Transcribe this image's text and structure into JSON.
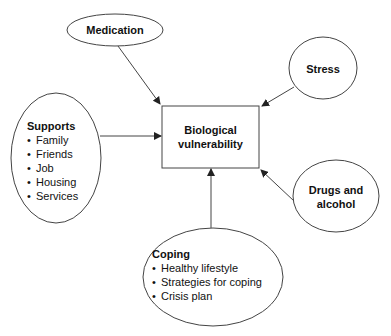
{
  "diagram": {
    "center": {
      "label_line1": "Biological",
      "label_line2": "vulnerability"
    },
    "medication": {
      "label": "Medication"
    },
    "stress": {
      "label": "Stress"
    },
    "drugs": {
      "label_line1": "Drugs and",
      "label_line2": "alcohol"
    },
    "supports": {
      "title": "Supports",
      "items": [
        "Family",
        "Friends",
        "Job",
        "Housing",
        "Services"
      ]
    },
    "coping": {
      "title": "Coping",
      "items": [
        "Healthy lifestyle",
        "Strategies for coping",
        "Crisis plan"
      ]
    },
    "colors": {
      "stroke": "#333333",
      "background": "#ffffff"
    }
  }
}
